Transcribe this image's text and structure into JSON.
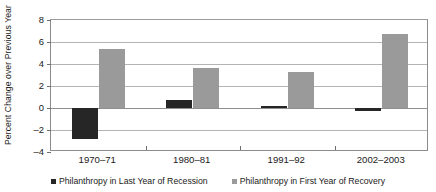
{
  "chart_data": {
    "type": "bar",
    "title": "",
    "subtitle": "",
    "xlabel": "",
    "ylabel": "Percent Change over Previous Year",
    "categories": [
      "1970–71",
      "1980–81",
      "1991–92",
      "2002–2003"
    ],
    "series": [
      {
        "name": "Philanthropy in Last Year of Recession",
        "color": "#262626",
        "values": [
          -2.8,
          0.7,
          0.2,
          -0.3
        ]
      },
      {
        "name": "Philanthropy in First Year of Recovery",
        "color": "#9a9a9a",
        "values": [
          5.4,
          3.6,
          3.3,
          6.7
        ]
      }
    ],
    "ylim": [
      -4,
      8
    ],
    "ytick_step": 2,
    "yticks": [
      8,
      6,
      4,
      2,
      0,
      -2,
      -4
    ],
    "ytick_labels": [
      "8",
      "6",
      "4",
      "2",
      "0",
      "–2",
      "–4"
    ],
    "grid": true,
    "grid_axis": "y",
    "legend": true,
    "legend_position": "bottom",
    "zero_line": 0,
    "bar_orientation": "vertical",
    "annotations": []
  },
  "axes": {
    "y_title": "Percent Change over Previous Year"
  },
  "legend": {
    "entries": [
      {
        "label": "Philanthropy in Last Year of Recession",
        "marker": "square-marker",
        "color": "#262626"
      },
      {
        "label": "Philanthropy in First Year of Recovery",
        "marker": "square-marker",
        "color": "#9a9a9a"
      }
    ]
  }
}
